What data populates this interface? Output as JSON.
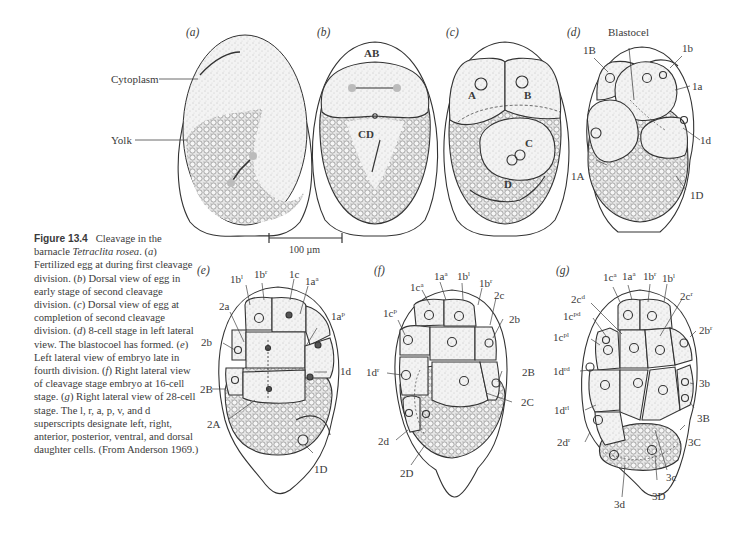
{
  "figure": {
    "number": "Figure 13.4",
    "caption_parts": [
      {
        "t": "Cleavage in the barnacle "
      },
      {
        "t": "Tetraclita rosea",
        "i": true
      },
      {
        "t": ". ("
      },
      {
        "t": "a",
        "i": true
      },
      {
        "t": ") Fertilized egg at during first cleavage division. ("
      },
      {
        "t": "b",
        "i": true
      },
      {
        "t": ") Dorsal view of egg in early stage of second cleavage division. ("
      },
      {
        "t": "c",
        "i": true
      },
      {
        "t": ") Dorsal view of egg at completion of second cleavage division. ("
      },
      {
        "t": "d",
        "i": true
      },
      {
        "t": ") 8-cell stage in left lateral view. The blastocoel has formed. ("
      },
      {
        "t": "e",
        "i": true
      },
      {
        "t": ") Left lateral view of embryo late in fourth division. ("
      },
      {
        "t": "f",
        "i": true
      },
      {
        "t": ") Right lateral view of cleavage stage embryo at 16-cell stage. ("
      },
      {
        "t": "g",
        "i": true
      },
      {
        "t": ") Right lateral view of 28-cell stage. The l, r, a, p, v, and d superscripts designate left, right, anterior, posterior, ventral, and dorsal daughter cells. (From Anderson 1969.)"
      }
    ],
    "scale_bar": "100 µm"
  },
  "panels": {
    "a": {
      "letter": "a",
      "labels": {
        "cytoplasm": "Cytoplasm",
        "yolk": "Yolk"
      }
    },
    "b": {
      "letter": "b",
      "labels": {
        "ab": "AB",
        "cd": "CD"
      }
    },
    "c": {
      "letter": "c",
      "labels": {
        "a": "A",
        "b": "B",
        "c": "C",
        "d": "D"
      }
    },
    "d": {
      "letter": "d",
      "labels": {
        "blastocel": "Blastocel",
        "1B": "1B",
        "1b": "1b",
        "1a": "1a",
        "1d": "1d",
        "1A": "1A",
        "1D": "1D"
      }
    },
    "e": {
      "letter": "e",
      "labels": [
        {
          "base": "1b",
          "sup": "l"
        },
        {
          "base": "1b",
          "sup": "r"
        },
        {
          "base": "1c",
          "sup": ""
        },
        {
          "base": "1a",
          "sup": "a"
        },
        {
          "base": "2a",
          "sup": ""
        },
        {
          "base": "1a",
          "sup": "p"
        },
        {
          "base": "2b",
          "sup": ""
        },
        {
          "base": "1d",
          "sup": ""
        },
        {
          "base": "2B",
          "sup": ""
        },
        {
          "base": "2A",
          "sup": ""
        },
        {
          "base": "1D",
          "sup": ""
        }
      ]
    },
    "f": {
      "letter": "f",
      "labels": [
        {
          "base": "1a",
          "sup": "a"
        },
        {
          "base": "1b",
          "sup": "l"
        },
        {
          "base": "1c",
          "sup": "a"
        },
        {
          "base": "1b",
          "sup": "r"
        },
        {
          "base": "2c",
          "sup": ""
        },
        {
          "base": "1c",
          "sup": "p"
        },
        {
          "base": "2b",
          "sup": ""
        },
        {
          "base": "1d",
          "sup": "r"
        },
        {
          "base": "2B",
          "sup": ""
        },
        {
          "base": "2C",
          "sup": ""
        },
        {
          "base": "2d",
          "sup": ""
        },
        {
          "base": "2D",
          "sup": ""
        }
      ]
    },
    "g": {
      "letter": "g",
      "labels": [
        {
          "base": "1c",
          "sup": "a"
        },
        {
          "base": "1a",
          "sup": "a"
        },
        {
          "base": "1b",
          "sup": "r"
        },
        {
          "base": "1b",
          "sup": "l"
        },
        {
          "base": "2c",
          "sup": "d"
        },
        {
          "base": "2c",
          "sup": "r"
        },
        {
          "base": "1c",
          "sup": "pd"
        },
        {
          "base": "1c",
          "sup": "pl"
        },
        {
          "base": "2b",
          "sup": "r"
        },
        {
          "base": "1d",
          "sup": "rd"
        },
        {
          "base": "3b",
          "sup": ""
        },
        {
          "base": "3B",
          "sup": ""
        },
        {
          "base": "1d",
          "sup": "rl"
        },
        {
          "base": "2d",
          "sup": "r"
        },
        {
          "base": "3C",
          "sup": ""
        },
        {
          "base": "3c",
          "sup": ""
        },
        {
          "base": "3D",
          "sup": ""
        },
        {
          "base": "3d",
          "sup": ""
        }
      ]
    }
  }
}
